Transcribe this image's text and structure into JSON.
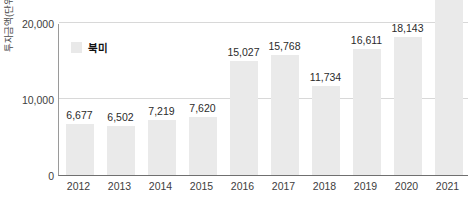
{
  "chart_data": {
    "type": "bar",
    "title": "",
    "xlabel": "",
    "ylabel": "투자금액(단위 : 백만원)",
    "categories": [
      "2012",
      "2013",
      "2014",
      "2015",
      "2016",
      "2017",
      "2018",
      "2019",
      "2020",
      "2021"
    ],
    "values": [
      6677,
      6502,
      7219,
      7620,
      15027,
      15768,
      11734,
      16611,
      18143,
      23500
    ],
    "value_labels": [
      "6,677",
      "6,502",
      "7,219",
      "7,620",
      "15,027",
      "15,768",
      "11,734",
      "16,611",
      "18,143",
      "23,3"
    ],
    "series": [
      {
        "name": "북미",
        "values": [
          6677,
          6502,
          7219,
          7620,
          15027,
          15768,
          11734,
          16611,
          18143,
          23500
        ]
      }
    ],
    "ylim": [
      0,
      20000
    ],
    "y_ticks": [
      0,
      10000,
      20000
    ],
    "y_tick_labels": [
      "0",
      "10,000",
      "20,000"
    ],
    "grid": true,
    "legend_position": "top-left",
    "bar_color": "#eaeaea",
    "note": "2021 bar extends beyond the top of the visible canvas; its value label is clipped."
  },
  "legend": {
    "entries": [
      {
        "label": "북미",
        "color": "#e9e9e9"
      }
    ]
  },
  "axes": {
    "y_title": "투자금액(단위 : 백만원)"
  }
}
